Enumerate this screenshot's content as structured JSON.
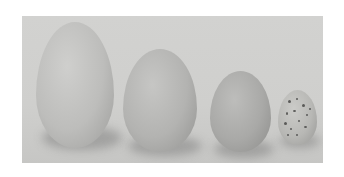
{
  "image": {
    "description": "Photograph of four eggs arranged left to right in decreasing size on a light gray background",
    "background_color": "#d0d0ce",
    "eggs": [
      {
        "label": "egg-1-largest",
        "color": "#bdbdbb"
      },
      {
        "label": "egg-2",
        "color": "#b3b3b1"
      },
      {
        "label": "egg-3",
        "color": "#a9a9a7"
      },
      {
        "label": "egg-4-speckled-smallest",
        "color": "#b8b8b5"
      }
    ]
  }
}
